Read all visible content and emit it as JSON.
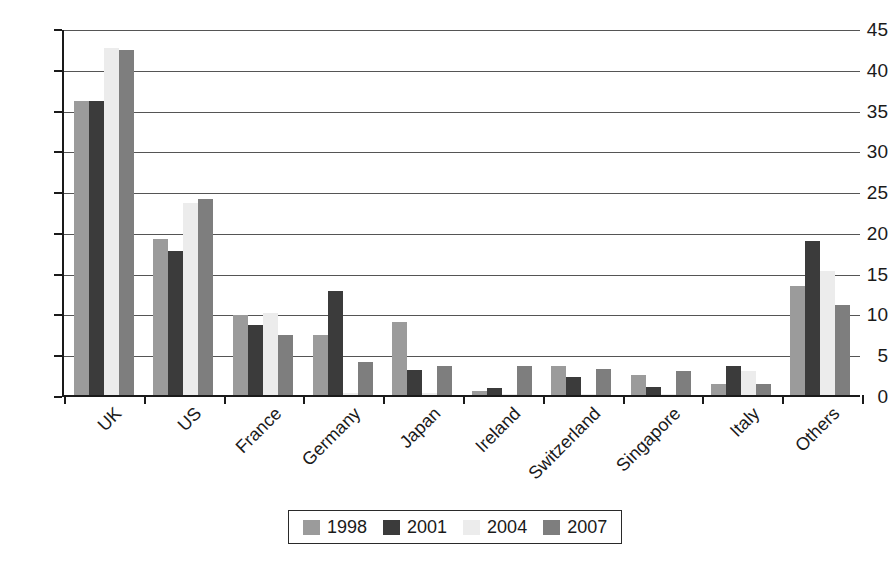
{
  "chart_data": {
    "type": "bar",
    "title": "",
    "subtitle": "",
    "xlabel": "",
    "ylabel": "",
    "ylim": [
      0,
      45
    ],
    "ytick_step": 5,
    "yticks": [
      0,
      5,
      10,
      15,
      20,
      25,
      30,
      35,
      40,
      45
    ],
    "ytick_labels": [
      "0",
      "5",
      "10",
      "15",
      "20",
      "25",
      "30",
      "35",
      "40",
      "45"
    ],
    "grid": "horizontal",
    "legend_position": "bottom",
    "categories": [
      "UK",
      "US",
      "France",
      "Germany",
      "Japan",
      "Ireland",
      "Switzerland",
      "Singapore",
      "Italy",
      "Others"
    ],
    "series": [
      {
        "name": "1998",
        "color": "#9b9b9b",
        "values": [
          36.1,
          19.1,
          9.8,
          7.3,
          9.0,
          0.5,
          3.6,
          2.5,
          1.4,
          13.4
        ]
      },
      {
        "name": "2001",
        "color": "#3b3b3b",
        "values": [
          36.1,
          17.6,
          8.6,
          12.8,
          3.1,
          0.9,
          2.2,
          1.0,
          3.5,
          18.9
        ]
      },
      {
        "name": "2004",
        "color": "#ececec",
        "values": [
          42.5,
          23.6,
          10.1,
          0.2,
          0.2,
          0.1,
          0.1,
          0.1,
          2.9,
          15.2
        ]
      },
      {
        "name": "2007",
        "color": "#7e7e7e",
        "values": [
          42.3,
          24.0,
          7.3,
          4.0,
          3.6,
          3.6,
          3.2,
          2.9,
          1.4,
          11.0
        ]
      }
    ]
  },
  "legend": {
    "entries": [
      {
        "label": "1998",
        "color": "#9b9b9b"
      },
      {
        "label": "2001",
        "color": "#3b3b3b"
      },
      {
        "label": "2004",
        "color": "#ececec"
      },
      {
        "label": "2007",
        "color": "#7e7e7e"
      }
    ]
  },
  "colors": {
    "axis": "#1a1a1a",
    "gridline": "#555555",
    "background": "#ffffff",
    "series_1998": "#9b9b9b",
    "series_2001": "#3b3b3b",
    "series_2004": "#ececec",
    "series_2007": "#7e7e7e"
  }
}
